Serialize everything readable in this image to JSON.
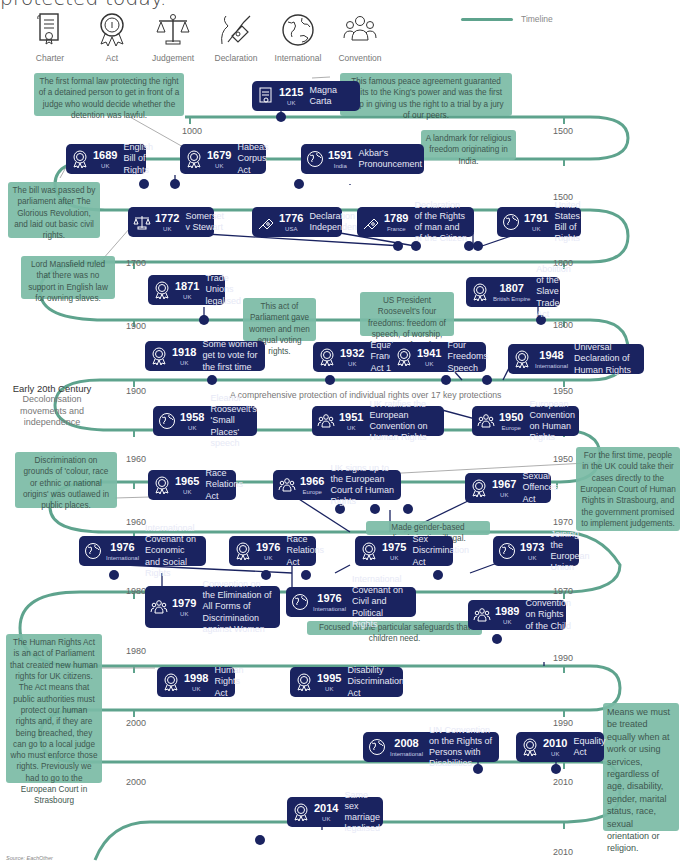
{
  "intro": {
    "text": "protected today."
  },
  "legend": {
    "icons": [
      {
        "name": "charter-icon",
        "label": "Charter"
      },
      {
        "name": "act-icon",
        "label": "Act"
      },
      {
        "name": "judgement-icon",
        "label": "Judgement"
      },
      {
        "name": "declaration-icon",
        "label": "Declaration"
      },
      {
        "name": "international-icon",
        "label": "International"
      },
      {
        "name": "convention-icon",
        "label": "Convention"
      }
    ],
    "timeline_label": "Timeline"
  },
  "colors": {
    "timeline": "#5ea38d",
    "event_box": "#1a2360",
    "note_box": "#7bbba6"
  },
  "ticks": [
    "1000",
    "1500",
    "1500",
    "1700",
    "1800",
    "1800",
    "1900",
    "1900",
    "1950",
    "1960",
    "1950",
    "1960",
    "1970",
    "1980",
    "1970",
    "1980",
    "1990",
    "2000",
    "1990",
    "2000",
    "2010",
    "2010"
  ],
  "era": {
    "heading": "Early 20th Century",
    "sub": "Decolonisation movements and independence"
  },
  "caption_17": "A comprehensive protection of individual rights over 17 key protections",
  "events": [
    {
      "year": "1215",
      "country": "UK",
      "title": "Magna Carta",
      "type": "charter"
    },
    {
      "year": "1689",
      "country": "UK",
      "title": "English Bill of Rights",
      "type": "act"
    },
    {
      "year": "1679",
      "country": "UK",
      "title": "Habeas Corpus Act",
      "type": "act"
    },
    {
      "year": "1591",
      "country": "India",
      "title": "Akbar's Pronouncement",
      "type": "international"
    },
    {
      "year": "1772",
      "country": "UK",
      "title": "Somerset v Stewart",
      "type": "judgement"
    },
    {
      "year": "1776",
      "country": "USA",
      "title": "Declaration of Independence",
      "type": "declaration"
    },
    {
      "year": "1789",
      "country": "France",
      "title": "Declaration of the Rights of man and of the Citizen",
      "type": "declaration"
    },
    {
      "year": "1791",
      "country": "UK",
      "title": "United States Bill of Rights",
      "type": "international"
    },
    {
      "year": "1871",
      "country": "UK",
      "title": "Trade Unions legalised",
      "type": "act"
    },
    {
      "year": "1807",
      "country": "British Empire",
      "title": "Abolition of the Slave Trade Act",
      "type": "act"
    },
    {
      "year": "1918",
      "country": "UK",
      "title": "Some women get to vote for the first time",
      "type": "act"
    },
    {
      "year": "1932",
      "country": "UK",
      "title": "Equal Franchise Act 1928",
      "type": "act"
    },
    {
      "year": "1941",
      "country": "UK",
      "title": "Four Freedoms Speech",
      "type": "act"
    },
    {
      "year": "1948",
      "country": "International",
      "title": "Universal Declaration of Human Rights",
      "type": "act"
    },
    {
      "year": "1958",
      "country": "UK",
      "title": "Eleanor Roosevelt's 'Small Places' speech",
      "type": "international"
    },
    {
      "year": "1951",
      "country": "UK",
      "title": "UK ratifies the European Convention on Human Rights",
      "type": "convention"
    },
    {
      "year": "1950",
      "country": "Europe",
      "title": "European Convention on Human Rights",
      "type": "convention"
    },
    {
      "year": "1965",
      "country": "UK",
      "title": "Race Relations Act",
      "type": "act"
    },
    {
      "year": "1966",
      "country": "Europe",
      "title": "UK signs up to the European Court of Human Rights",
      "type": "convention"
    },
    {
      "year": "1967",
      "country": "UK",
      "title": "Sexual Offences Act",
      "type": "act"
    },
    {
      "year": "1976",
      "country": "International",
      "title": "International Covenant on Economic and Social Rights",
      "type": "international"
    },
    {
      "year": "1976",
      "country": "UK",
      "title": "Race Relations Act",
      "type": "act"
    },
    {
      "year": "1975",
      "country": "UK",
      "title": "Sex Discrimination Act",
      "type": "act"
    },
    {
      "year": "1973",
      "country": "UK",
      "title": "Joining the European Union",
      "type": "international"
    },
    {
      "year": "1979",
      "country": "UK",
      "title": "Convention on the Elimination of All Forms of Discrimination against Women",
      "type": "convention"
    },
    {
      "year": "1976",
      "country": "International",
      "title": "International Covenant on Civil and Political Rights",
      "type": "international"
    },
    {
      "year": "1989",
      "country": "UK",
      "title": "Convention on Rights of the Child",
      "type": "convention"
    },
    {
      "year": "1998",
      "country": "UK",
      "title": "Human Rights Act",
      "type": "act"
    },
    {
      "year": "1995",
      "country": "UK",
      "title": "Disability Discrimination Act",
      "type": "act"
    },
    {
      "year": "2008",
      "country": "International",
      "title": "UN Convention on the Rights of Persons with Disabilities",
      "type": "international"
    },
    {
      "year": "2010",
      "country": "UK",
      "title": "Equality Act",
      "type": "act"
    },
    {
      "year": "2014",
      "country": "UK",
      "title": "Same sex marriage legalised",
      "type": "act"
    }
  ],
  "notes": {
    "habeas": "The first formal law protecting the right of a detained person to get in front of a judge who would decide whether the detention was lawful.",
    "magna": "This famous peace agreement guaranted limits to the King's power and was the first step in giving us the right to a trial by a jury of our peers.",
    "akbar": "A landmark for religious freedom originating in India.",
    "billrights": "The bill was passed by parliament after The Glorious Revolution, and laid out basic civil rights.",
    "mansfield": "Lord Mansfield ruled that there was no support in English law for owning slaves.",
    "equalvote": "This act of Parliament gave women and men equal voting rights.",
    "fourfreedoms": "US President Roosevelt's four freedoms: freedom of speech, of worship, from want, from fear.",
    "racerel": "Discrimination on grounds of 'colour, race or ethnic or national origins' was outlawed in public places.",
    "echr": "For the first time, people in the UK could take their cases directly to the European Court of Human Rights in Strasbourg, and the government promised to implement judgements.",
    "sexdisc": "Made gender-based discrimination illegal.",
    "children": "Focused on the particular safeguards that children need.",
    "hra": "The Human Rights Act is an act of Parliament that created new human rights for UK citizens. The Act means that public authorities must protect our human rights and, if they are being breached, they can go to a local judge who must enforce those rights. Previously we had to go to the European Court in Strasbourg",
    "equality": "Means we must be treated equally when at work or using services, regardless of age, disability, gender, marital status, race, sexual orientation or religion."
  },
  "source": "Source: EachOther"
}
